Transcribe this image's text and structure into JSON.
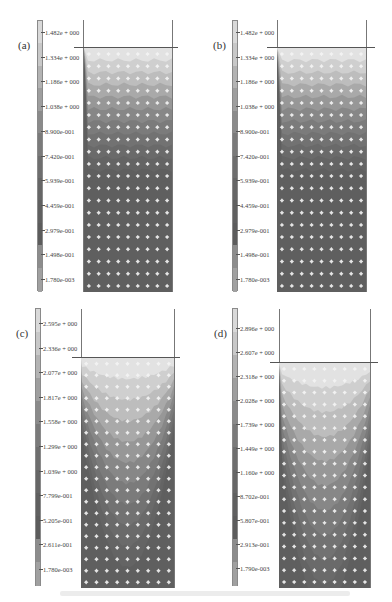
{
  "chart_data": [
    {
      "type": "heatmap",
      "panel": "(a)",
      "title": "",
      "colorbar_labels": [
        "1.482e + 000",
        "1.334e + 000",
        "1.186e + 000",
        "1.038e + 000",
        "8.900e-001",
        "7.420e-001",
        "5.939e-001",
        "4.459e-001",
        "2.979e-001",
        "1.498e-001",
        "1.780e-003"
      ],
      "colorbar_values": [
        1.482,
        1.334,
        1.186,
        1.038,
        0.89,
        0.742,
        0.5939,
        0.4459,
        0.2979,
        0.1498,
        0.00178
      ],
      "field_pattern": "nearly horizontal bands, high values at free surface decreasing with depth",
      "grid": "particle grid 9 columns x 20 rows"
    },
    {
      "type": "heatmap",
      "panel": "(b)",
      "title": "",
      "colorbar_labels": [
        "1.482e + 000",
        "1.334e + 000",
        "1.186e + 000",
        "1.038e + 000",
        "8.900e-001",
        "7.420e-001",
        "5.939e-001",
        "4.459e-001",
        "2.979e-001",
        "1.498e-001",
        "1.780e-003"
      ],
      "colorbar_values": [
        1.482,
        1.334,
        1.186,
        1.038,
        0.89,
        0.742,
        0.5939,
        0.4459,
        0.2979,
        0.1498,
        0.00178
      ],
      "field_pattern": "nearly horizontal bands with slight irregularity, high at surface",
      "grid": "particle grid 9 columns x 20 rows"
    },
    {
      "type": "heatmap",
      "panel": "(c)",
      "title": "",
      "colorbar_labels": [
        "2.595e + 000",
        "2.336e + 000",
        "2.077e + 000",
        "1.817e + 000",
        "1.558e + 000",
        "1.299e + 000",
        "1.039e + 000",
        "7.799e-001",
        "5.205e-001",
        "2.611e-001",
        "1.780e-003"
      ],
      "colorbar_values": [
        2.595,
        2.336,
        2.077,
        1.817,
        1.558,
        1.299,
        1.039,
        0.7799,
        0.5205,
        0.2611,
        0.00178
      ],
      "field_pattern": "U-shaped (bowl) contours, high near surface centre",
      "grid": "particle grid 9 columns x 20 rows"
    },
    {
      "type": "heatmap",
      "panel": "(d)",
      "title": "",
      "colorbar_labels": [
        "2.896e + 000",
        "2.607e + 000",
        "2.318e + 000",
        "2.028e + 000",
        "1.739e + 000",
        "1.449e + 000",
        "1.160e + 000",
        "8.702e-001",
        "5.807e-001",
        "2.913e-001",
        "1.790e-003"
      ],
      "colorbar_values": [
        2.896,
        2.607,
        2.318,
        2.028,
        1.739,
        1.449,
        1.16,
        0.8702,
        0.5807,
        0.2913,
        0.00179
      ],
      "field_pattern": "deep U-shaped (bowl) contours, high near surface centre",
      "grid": "particle grid 9 columns x 19 rows"
    }
  ],
  "panels": {
    "a": {
      "label": "(a)",
      "ticks": [
        "1.482e + 000",
        "1.334e + 000",
        "1.186e + 000",
        "1.038e + 000",
        "8.900e-001",
        "7.420e-001",
        "5.939e-001",
        "4.459e-001",
        "2.979e-001",
        "1.498e-001",
        "1.780e-003"
      ]
    },
    "b": {
      "label": "(b)",
      "ticks": [
        "1.482e + 000",
        "1.334e + 000",
        "1.186e + 000",
        "1.038e + 000",
        "8.900e-001",
        "7.420e-001",
        "5.939e-001",
        "4.459e-001",
        "2.979e-001",
        "1.498e-001",
        "1.780e-003"
      ]
    },
    "c": {
      "label": "(c)",
      "ticks": [
        "2.595e + 000",
        "2.336e + 000",
        "2.077e + 000",
        "1.817e + 000",
        "1.558e + 000",
        "1.299e + 000",
        "1.039e + 000",
        "7.799e-001",
        "5.205e-001",
        "2.611e-001",
        "1.780e-003"
      ]
    },
    "d": {
      "label": "(d)",
      "ticks": [
        "2.896e + 000",
        "2.607e + 000",
        "2.318e + 000",
        "2.028e + 000",
        "1.739e + 000",
        "1.449e + 000",
        "1.160e + 000",
        "8.702e-001",
        "5.807e-001",
        "2.913e-001",
        "1.790e-003"
      ]
    }
  },
  "colors": {
    "band_shades": [
      "#d9d9d9",
      "#c8c8c8",
      "#b3b3b3",
      "#9e9e9e",
      "#8a8a8a",
      "#7a7a7a",
      "#6e6e6e",
      "#666666",
      "#606060",
      "#5c5c5c",
      "#8c8c8c",
      "#a0a0a0"
    ],
    "particle": "#f4f4f4",
    "wall": "#777777"
  }
}
